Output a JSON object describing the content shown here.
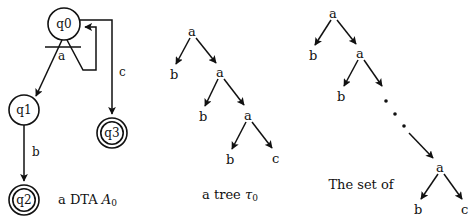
{
  "figure": {
    "background": "#ffffff",
    "ink": "#111111"
  },
  "automaton": {
    "caption": "a DTA ",
    "caption_symbol": "A",
    "caption_subscript": "0",
    "states": [
      {
        "id": "q0",
        "label": "q0",
        "cx": 64,
        "cy": 24,
        "r": 16,
        "accepting": false
      },
      {
        "id": "q1",
        "label": "q1",
        "cx": 24,
        "cy": 110,
        "r": 15,
        "accepting": false
      },
      {
        "id": "q2",
        "label": "q2",
        "cx": 24,
        "cy": 200,
        "r": 15,
        "accepting": true
      },
      {
        "id": "q3",
        "label": "q3",
        "cx": 112,
        "cy": 133,
        "r": 15,
        "accepting": true
      }
    ],
    "transitions": [
      {
        "label": "a",
        "from": "q0",
        "to": "q1",
        "kind": "fork-left"
      },
      {
        "label": "a",
        "from": "q0",
        "to": "q0",
        "kind": "fork-right-loop"
      },
      {
        "label": "b",
        "from": "q1",
        "to": "q2",
        "kind": "straight"
      },
      {
        "label": "c",
        "from": "q0",
        "to": "q3",
        "kind": "elbow"
      }
    ],
    "edge_labels": {
      "a": "a",
      "b": "b",
      "c": "c"
    }
  },
  "tree_example": {
    "caption": "a tree ",
    "caption_symbol": "τ",
    "caption_subscript": "0",
    "nodes": [
      {
        "label": "a",
        "x": 192,
        "y": 32
      },
      {
        "label": "b",
        "x": 174,
        "y": 75
      },
      {
        "label": "a",
        "x": 220,
        "y": 73
      },
      {
        "label": "b",
        "x": 203,
        "y": 117
      },
      {
        "label": "a",
        "x": 248,
        "y": 116
      },
      {
        "label": "b",
        "x": 230,
        "y": 160
      },
      {
        "label": "c",
        "x": 276,
        "y": 159
      }
    ]
  },
  "tree_set": {
    "caption_lines": [
      "The set of",
      "trees accepted",
      "by "
    ],
    "caption_symbol": "A",
    "caption_subscript": "0",
    "nodes": [
      {
        "label": "a",
        "x": 333,
        "y": 14
      },
      {
        "label": "b",
        "x": 313,
        "y": 56
      },
      {
        "label": "a",
        "x": 360,
        "y": 54
      },
      {
        "label": "b",
        "x": 341,
        "y": 97
      },
      {
        "label": "a",
        "x": 440,
        "y": 168
      },
      {
        "label": "b",
        "x": 418,
        "y": 210
      },
      {
        "label": "c",
        "x": 465,
        "y": 210
      }
    ],
    "ellipsis_dots": [
      {
        "x": 386,
        "y": 101
      },
      {
        "x": 395,
        "y": 114
      },
      {
        "x": 404,
        "y": 126
      }
    ]
  }
}
